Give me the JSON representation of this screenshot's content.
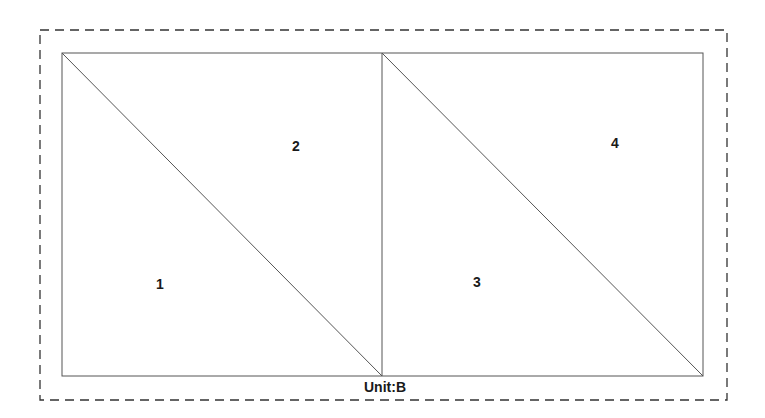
{
  "diagram": {
    "unit_label": "Unit:B",
    "regions": [
      {
        "id": "1",
        "label": "1",
        "x": 160,
        "y": 288
      },
      {
        "id": "2",
        "label": "2",
        "x": 296,
        "y": 150
      },
      {
        "id": "3",
        "label": "3",
        "x": 477,
        "y": 286
      },
      {
        "id": "4",
        "label": "4",
        "x": 615,
        "y": 147
      }
    ],
    "colors": {
      "stroke": "#555555",
      "dashed_border": "#333333",
      "text": "#1a1a1a"
    }
  }
}
